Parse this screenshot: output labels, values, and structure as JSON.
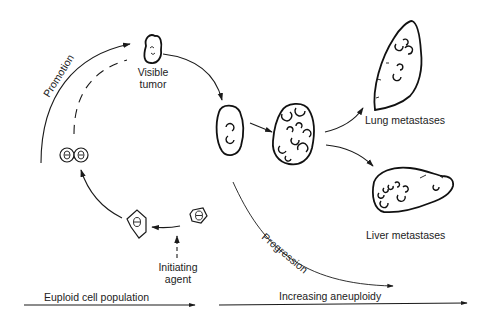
{
  "diagram": {
    "labels": {
      "visible_tumor_line1": "Visible",
      "visible_tumor_line2": "tumor",
      "promotion": "Promotion",
      "progression": "Progression",
      "initiating_agent_line1": "Initiating",
      "initiating_agent_line2": "agent",
      "lung_metastases": "Lung metastases",
      "liver_metastases": "Liver metastases",
      "euploid_axis": "Euploid cell population",
      "aneuploid_axis": "Increasing aneuploidy"
    },
    "stages": [
      {
        "id": "normal-cell",
        "shape": "hexagon-small"
      },
      {
        "id": "initiated-cell",
        "shape": "hexagon-irregular"
      },
      {
        "id": "dividing-cells",
        "shape": "double-circle"
      },
      {
        "id": "visible-tumor",
        "shape": "small-tumor"
      },
      {
        "id": "growing-tumor",
        "shape": "oval-tumor"
      },
      {
        "id": "advanced-tumor",
        "shape": "large-tumor"
      },
      {
        "id": "lung-metastases",
        "shape": "lung"
      },
      {
        "id": "liver-metastases",
        "shape": "liver"
      }
    ],
    "colors": {
      "ink": "#1a1a1a",
      "background": "#ffffff"
    }
  }
}
